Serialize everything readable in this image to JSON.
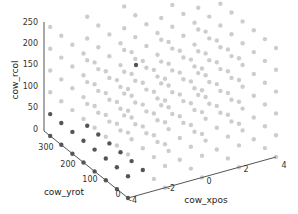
{
  "chart_data": {
    "type": "scatter",
    "projection": "3d",
    "title": "",
    "xlabel": "cow_xpos",
    "ylabel": "cow_yrot",
    "zlabel": "cow_rcol",
    "x_ticks": [
      "-4",
      "-2",
      "0",
      "2",
      "4"
    ],
    "y_ticks": [
      "0",
      "100",
      "200",
      "300"
    ],
    "z_ticks": [
      "0",
      "50",
      "100",
      "150",
      "200",
      "250"
    ],
    "xlim": [
      -4,
      4
    ],
    "ylim": [
      0,
      360
    ],
    "zlim": [
      0,
      250
    ],
    "grid": false,
    "series": [
      {
        "name": "all samples",
        "color": "#c8c8c8",
        "description": "regular 3D grid of points over xpos [-4,4], yrot [0,360], rcol [0,255]"
      },
      {
        "name": "highlighted",
        "color": "#555555",
        "description": "points along xpos=-4 edge / low rcol, plus one isolated point near center"
      }
    ]
  },
  "colors": {
    "light_point": "#c8c8c8",
    "dark_point": "#555555",
    "axis": "#555555"
  }
}
